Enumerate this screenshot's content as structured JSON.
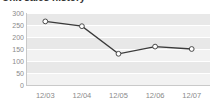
{
  "chart_data": {
    "type": "line",
    "title": "Unit sales history",
    "categories": [
      "12/03",
      "12/04",
      "12/05",
      "12/06",
      "12/07"
    ],
    "values": [
      265,
      245,
      130,
      160,
      150
    ],
    "series": [
      {
        "name": "Units",
        "values": [
          265,
          245,
          130,
          160,
          150
        ]
      }
    ],
    "xlabel": "",
    "ylabel": "",
    "ylim": [
      0,
      300
    ],
    "yticks": [
      300,
      250,
      200,
      150,
      100,
      50,
      0
    ],
    "grid": true,
    "legend": "none",
    "marker": "circle-open",
    "line_color": "#3a3a3a",
    "marker_fill": "#ffffff",
    "plot_background": "#f2f2f2",
    "band_color": "#e8e8e8",
    "gridline_color": "#ffffff",
    "tick_label_color": "#8a8a8a"
  }
}
